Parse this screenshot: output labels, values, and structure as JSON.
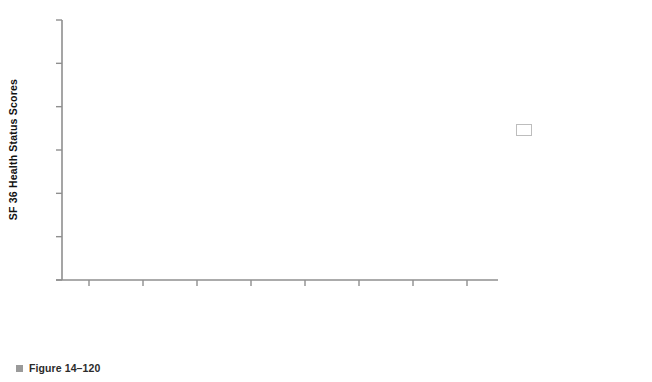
{
  "chart_data": {
    "type": "line",
    "title": "",
    "xlabel": "",
    "ylabel": "SF 36 Health Status Scores",
    "ylim": [
      25,
      85
    ],
    "yticks": [
      25,
      35,
      45,
      55,
      65,
      75,
      85
    ],
    "grid": false,
    "legend_position": "right",
    "categories": [
      "Physical Role",
      "Comfort",
      "Physical Function",
      "Emotional Role",
      "Social Function",
      "Vitality",
      "Mental Health",
      "General Health"
    ],
    "category_lines": [
      [
        "Physical Role"
      ],
      [
        "Comfort"
      ],
      [
        "Physical",
        "Function"
      ],
      [
        "Emotional Role"
      ],
      [
        "Social Function"
      ],
      [
        "Vitality"
      ],
      [
        "Mental Health"
      ],
      [
        "General Health"
      ]
    ],
    "series": [
      {
        "name": "TUBS (101)",
        "color": "#111111",
        "marker_color": "#111111",
        "values": [
          52.0,
          60.0,
          85.0,
          86.0,
          84.0,
          67.0,
          78.5,
          82.0
        ]
      },
      {
        "name": "AMBRII (70)",
        "color": "#111111",
        "marker_color": "#5a5a5a",
        "values": [
          35.0,
          43.5,
          78.0,
          72.5,
          72.5,
          58.5,
          74.0,
          78.0
        ]
      },
      {
        "name": "Failed Repairs (76)",
        "color": "#111111",
        "marker_color": "#111111",
        "values": [
          28.0,
          43.5,
          71.0,
          70.5,
          66.0,
          55.0,
          67.5,
          67.5
        ]
      }
    ]
  },
  "legend": {
    "entries": [
      {
        "label": "TUBS (101)"
      },
      {
        "label": "AMBRII (70)"
      },
      {
        "label": "Failed Repairs (76)"
      }
    ]
  },
  "caption": {
    "text": "Figure 14–120",
    "bullet_color": "#9a9a9a"
  },
  "axes": {
    "axis_color": "#8f8f8f",
    "tick_color": "#8f8f8f"
  }
}
